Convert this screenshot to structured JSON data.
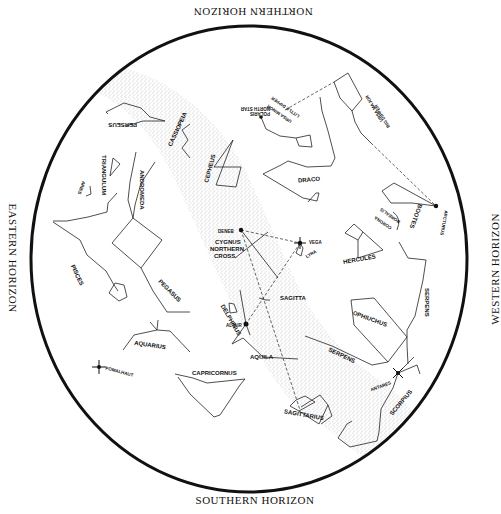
{
  "map": {
    "type": "star-chart",
    "horizons": {
      "north": "NORTHERN HORIZON",
      "south": "SOUTHERN HORIZON",
      "east": "EASTERN HORIZON",
      "west": "WESTERN HORIZON"
    },
    "constellations": {
      "perseus": "PERSEUS",
      "cassiopeia": "CASSIOPEIA",
      "cepheus": "CEPHEUS",
      "triangulum": "TRIANGULUM",
      "aries": "ARIES",
      "andromeda": "ANDROMEDA",
      "pisces": "PISCES",
      "pegasus": "PEGASUS",
      "aquarius": "AQUARIUS",
      "capricornus": "CAPRICORNUS",
      "delphinus": "DELPHINUS",
      "aquila": "AQUILA",
      "sagitta": "SAGITTA",
      "cygnus": "CYGNUS",
      "northern_cross": "NORTHERN",
      "northern_cross_2": "CROSS",
      "lyra": "LYRA",
      "draco": "DRACO",
      "ursa_minor": "URSA MINOR",
      "little_dipper": "LITTLE DIPPER",
      "ursa_major": "URSA MAJOR",
      "big_dipper": "BIG DIPPER",
      "bootes": "BOOTES",
      "corona_borealis_1": "CORONA",
      "corona_borealis_2": "BOREALIS",
      "hercules": "HERCULES",
      "serpens_head": "SERPENS",
      "ophiuchus": "OPHIUCHUS",
      "serpens_tail": "SERPENS",
      "scorpius": "SCORPIUS",
      "sagittarius": "SAGITTARIUS"
    },
    "stars": {
      "polaris": "POLARIS",
      "north_star": "NORTH STAR",
      "deneb": "DENEB",
      "vega": "VEGA",
      "altair": "ALTAIR",
      "arcturus": "ARCTURUS",
      "antares": "ANTARES",
      "fomalhaut": "FOMALHAUT"
    },
    "colors": {
      "ink": "#111111",
      "background": "#ffffff",
      "milky_way": "#b0b0b0"
    }
  }
}
